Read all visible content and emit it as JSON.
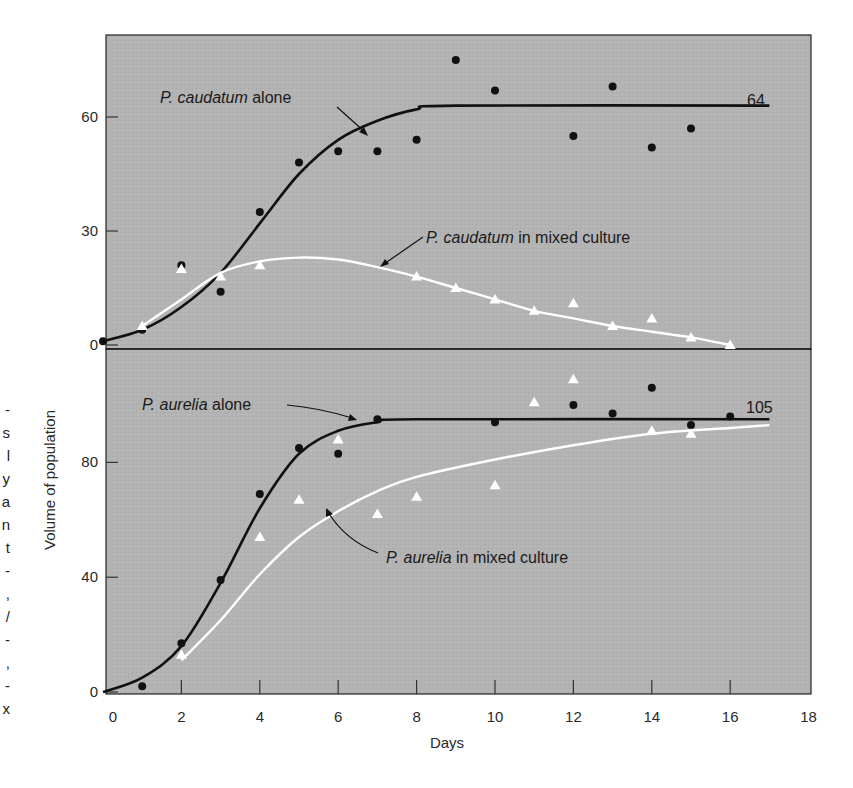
{
  "chart_data": {
    "type": "line",
    "layout": "two stacked panels sharing x-axis",
    "xlabel": "Days",
    "ylabel": "Volume of population",
    "xlim": [
      0,
      18
    ],
    "x_ticks": [
      0,
      2,
      4,
      6,
      8,
      10,
      12,
      14,
      16,
      18
    ],
    "grid": false,
    "background": "#b4b4b4",
    "panels": [
      {
        "name": "upper",
        "species": "P. caudatum",
        "ylim": [
          0,
          75
        ],
        "y_ticks": [
          0,
          30,
          60
        ],
        "series": [
          {
            "name": "P. caudatum alone",
            "label_italic": "P. caudatum",
            "label_rest": " alone",
            "marker": "circle",
            "color": "#111111",
            "asymptote_label": "64",
            "points": [
              [
                0,
                1
              ],
              [
                1,
                4
              ],
              [
                2,
                21
              ],
              [
                3,
                14
              ],
              [
                4,
                35
              ],
              [
                5,
                48
              ],
              [
                6,
                51
              ],
              [
                7,
                51
              ],
              [
                8,
                54
              ],
              [
                9,
                75
              ],
              [
                10,
                67
              ],
              [
                12,
                55
              ],
              [
                13,
                68
              ],
              [
                14,
                52
              ],
              [
                15,
                57
              ]
            ],
            "curve": [
              [
                0,
                1
              ],
              [
                1,
                4
              ],
              [
                2,
                10
              ],
              [
                3,
                19
              ],
              [
                4,
                32
              ],
              [
                5,
                45
              ],
              [
                6,
                54
              ],
              [
                7,
                59
              ],
              [
                8,
                62
              ],
              [
                9,
                63
              ],
              [
                17,
                63
              ]
            ]
          },
          {
            "name": "P. caudatum in mixed culture",
            "label_italic": "P. caudatum",
            "label_rest": " in mixed culture",
            "marker": "triangle",
            "color": "#ffffff",
            "points": [
              [
                1,
                5
              ],
              [
                2,
                20
              ],
              [
                3,
                18
              ],
              [
                4,
                21
              ],
              [
                8,
                18
              ],
              [
                9,
                15
              ],
              [
                10,
                12
              ],
              [
                11,
                9
              ],
              [
                12,
                11
              ],
              [
                13,
                5
              ],
              [
                14,
                7
              ],
              [
                15,
                2
              ],
              [
                16,
                0
              ]
            ],
            "curve": [
              [
                1,
                5
              ],
              [
                2,
                12
              ],
              [
                3,
                19
              ],
              [
                4,
                22
              ],
              [
                5,
                23
              ],
              [
                6,
                22.5
              ],
              [
                7,
                20.5
              ],
              [
                8,
                18
              ],
              [
                9,
                15
              ],
              [
                10,
                12
              ],
              [
                11,
                9
              ],
              [
                12,
                7
              ],
              [
                13,
                5
              ],
              [
                14,
                3.5
              ],
              [
                15,
                2
              ],
              [
                16,
                0
              ]
            ]
          }
        ]
      },
      {
        "name": "lower",
        "species": "P. aurelia",
        "ylim": [
          0,
          120
        ],
        "y_ticks": [
          0,
          40,
          80
        ],
        "series": [
          {
            "name": "P. aurelia alone",
            "label_italic": "P. aurelia",
            "label_rest": " alone",
            "marker": "circle",
            "color": "#111111",
            "asymptote_label": "105",
            "points": [
              [
                1,
                2
              ],
              [
                2,
                17
              ],
              [
                3,
                39
              ],
              [
                4,
                69
              ],
              [
                5,
                85
              ],
              [
                6,
                83
              ],
              [
                7,
                95
              ],
              [
                10,
                94
              ],
              [
                12,
                100
              ],
              [
                13,
                97
              ],
              [
                14,
                106
              ],
              [
                15,
                93
              ],
              [
                16,
                96
              ]
            ],
            "curve": [
              [
                0,
                0
              ],
              [
                1,
                5
              ],
              [
                2,
                16
              ],
              [
                3,
                38
              ],
              [
                4,
                64
              ],
              [
                5,
                83
              ],
              [
                6,
                91
              ],
              [
                7,
                94
              ],
              [
                8,
                95
              ],
              [
                17,
                95
              ]
            ]
          },
          {
            "name": "P. aurelia in mixed culture",
            "label_italic": "P. aurelia",
            "label_rest": " in mixed culture",
            "marker": "triangle",
            "color": "#ffffff",
            "points": [
              [
                2,
                13
              ],
              [
                4,
                54
              ],
              [
                5,
                67
              ],
              [
                6,
                88
              ],
              [
                7,
                62
              ],
              [
                8,
                68
              ],
              [
                10,
                72
              ],
              [
                11,
                101
              ],
              [
                12,
                109
              ],
              [
                14,
                91
              ],
              [
                15,
                90
              ]
            ],
            "curve": [
              [
                2,
                11
              ],
              [
                3,
                25
              ],
              [
                4,
                41
              ],
              [
                5,
                54
              ],
              [
                6,
                63
              ],
              [
                7,
                70
              ],
              [
                8,
                75
              ],
              [
                10,
                81
              ],
              [
                12,
                86
              ],
              [
                14,
                90
              ],
              [
                16,
                92
              ],
              [
                17,
                93
              ]
            ]
          }
        ]
      }
    ]
  },
  "labels": {
    "ylabel": "Volume of population",
    "xlabel": "Days",
    "upper_alone_italic": "P. caudatum",
    "upper_alone_rest": " alone",
    "upper_mixed_italic": "P. caudatum",
    "upper_mixed_rest": " in mixed culture",
    "lower_alone_italic": "P. aurelia",
    "lower_alone_rest": " alone",
    "lower_mixed_italic": "P. aurelia",
    "lower_mixed_rest": " in mixed culture",
    "upper_asymptote": "64",
    "lower_asymptote": "105"
  },
  "edge_fragment": [
    "-",
    "s",
    "l",
    "y",
    "a",
    "n",
    "t",
    "-",
    ",",
    "/",
    "-",
    ",",
    "-",
    "x"
  ]
}
